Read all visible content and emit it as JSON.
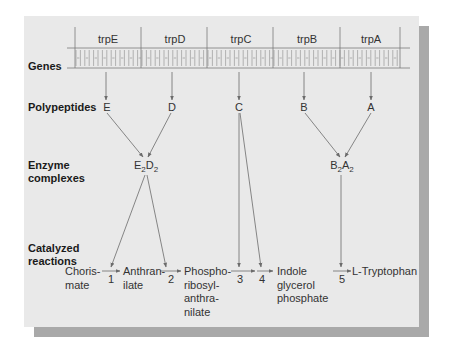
{
  "row_titles": {
    "genes": "Genes",
    "polypeptides": "Polypeptides",
    "enzyme_complexes": [
      "Enzyme",
      "complexes"
    ],
    "catalyzed_reactions": [
      "Catalyzed",
      "reactions"
    ]
  },
  "genes": [
    "trpE",
    "trpD",
    "trpC",
    "trpB",
    "trpA"
  ],
  "polypeptides": [
    "E",
    "D",
    "C",
    "B",
    "A"
  ],
  "enzyme_complexes": [
    {
      "a": "E",
      "a_sub": "2",
      "b": "D",
      "b_sub": "2"
    },
    {
      "a": "B",
      "a_sub": "2",
      "b": "A",
      "b_sub": "2"
    }
  ],
  "compounds": {
    "chorismate": [
      "Choris-",
      "mate"
    ],
    "anthranilate": [
      "Anthran-",
      "ilate"
    ],
    "phosphoribosyl": [
      "Phospho-",
      "ribosyl-",
      "anthra-",
      "nilate"
    ],
    "indole": [
      "Indole",
      "glycerol",
      "phosphate"
    ],
    "tryptophan": [
      "L-Tryptophan"
    ]
  },
  "steps": [
    "1",
    "2",
    "3",
    "4",
    "5"
  ],
  "colors": {
    "panel": "#e9e9e9",
    "shadow": "#a9a9a9",
    "line": "#6b6b6b",
    "text": "#2a2a2a"
  }
}
